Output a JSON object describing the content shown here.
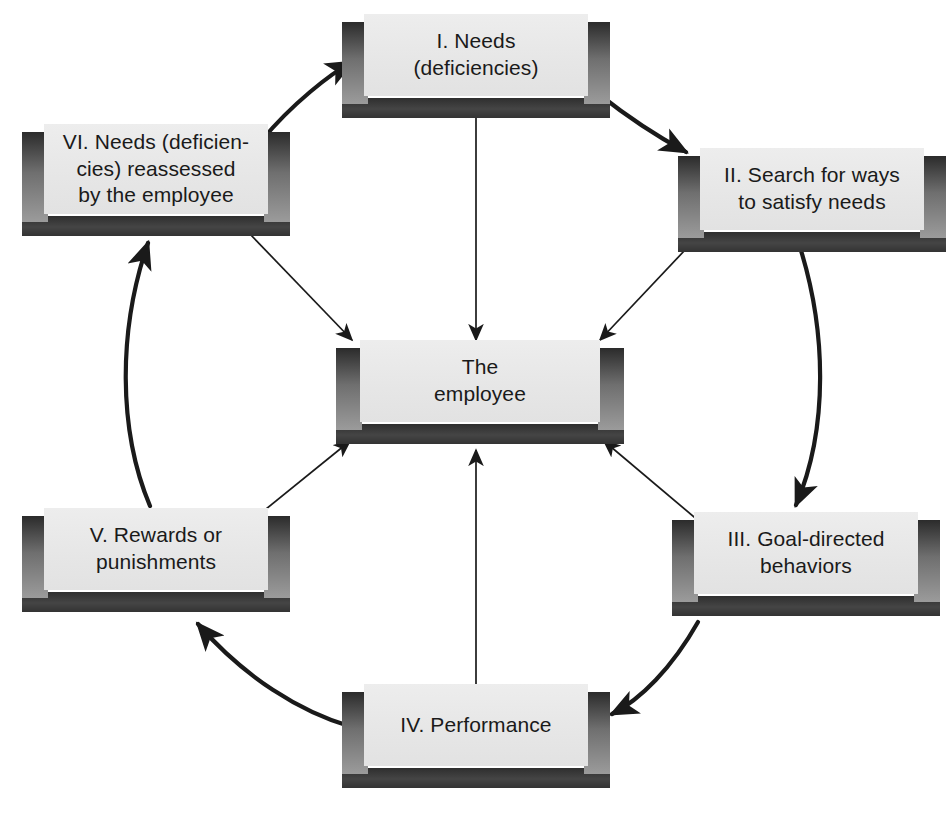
{
  "diagram": {
    "type": "cyclical-process-diagram",
    "background_color": "#ffffff",
    "box_face_color": "#e8e8e8",
    "box_shadow_color": "#333333",
    "text_color": "#1a1a1a",
    "arrow_color": "#1a1a1a"
  },
  "center": {
    "id": "center",
    "label": "The\nemployee",
    "name": "the-employee"
  },
  "nodes": [
    {
      "id": "I",
      "numeral": "I.",
      "label": "I.  Needs\n(deficiencies)",
      "name": "needs-deficiencies",
      "position": "top"
    },
    {
      "id": "II",
      "numeral": "II.",
      "label": "II.  Search for ways\nto satisfy needs",
      "name": "search-for-ways-to-satisfy-needs",
      "position": "top-right"
    },
    {
      "id": "III",
      "numeral": "III.",
      "label": "III.  Goal-directed\nbehaviors",
      "name": "goal-directed-behaviors",
      "position": "bottom-right"
    },
    {
      "id": "IV",
      "numeral": "IV.",
      "label": "IV.  Performance",
      "name": "performance",
      "position": "bottom"
    },
    {
      "id": "V",
      "numeral": "V.",
      "label": "V.  Rewards or\npunishments",
      "name": "rewards-or-punishments",
      "position": "bottom-left"
    },
    {
      "id": "VI",
      "numeral": "VI.",
      "label": "VI.  Needs (deficien-\ncies) reassessed\nby the employee",
      "name": "needs-reassessed-by-the-employee",
      "position": "top-left"
    }
  ],
  "ring_arrows": [
    {
      "from": "VI",
      "to": "I",
      "style": "thick-curved"
    },
    {
      "from": "I",
      "to": "II",
      "style": "thick-curved"
    },
    {
      "from": "II",
      "to": "III",
      "style": "thick-curved"
    },
    {
      "from": "III",
      "to": "IV",
      "style": "thick-curved"
    },
    {
      "from": "IV",
      "to": "V",
      "style": "thick-curved"
    },
    {
      "from": "V",
      "to": "VI",
      "style": "thick-curved"
    }
  ],
  "spoke_arrows": [
    {
      "from": "I",
      "to": "center",
      "style": "thin-straight"
    },
    {
      "from": "II",
      "to": "center",
      "style": "thin-straight"
    },
    {
      "from": "III",
      "to": "center",
      "style": "thin-straight"
    },
    {
      "from": "IV",
      "to": "center",
      "style": "thin-straight"
    },
    {
      "from": "V",
      "to": "center",
      "style": "thin-straight"
    },
    {
      "from": "VI",
      "to": "center",
      "style": "thin-straight"
    }
  ]
}
